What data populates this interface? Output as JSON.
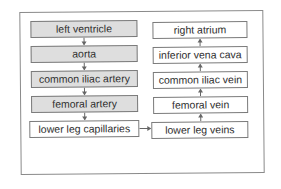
{
  "diagram": {
    "left_column": [
      {
        "label": "left ventricle",
        "style": "shaded"
      },
      {
        "label": "aorta",
        "style": "shaded"
      },
      {
        "label": "common iliac artery",
        "style": "shaded"
      },
      {
        "label": "femoral artery",
        "style": "shaded"
      },
      {
        "label": "lower leg capillaries",
        "style": "plain"
      }
    ],
    "right_column": [
      {
        "label": "right atrium",
        "style": "plain"
      },
      {
        "label": "inferior vena cava",
        "style": "plain"
      },
      {
        "label": "common iliac vein",
        "style": "plain"
      },
      {
        "label": "femoral vein",
        "style": "plain"
      },
      {
        "label": "lower leg veins",
        "style": "plain"
      }
    ],
    "connections": [
      {
        "from": "left ventricle",
        "to": "aorta",
        "direction": "down"
      },
      {
        "from": "aorta",
        "to": "common iliac artery",
        "direction": "down"
      },
      {
        "from": "common iliac artery",
        "to": "femoral artery",
        "direction": "down"
      },
      {
        "from": "femoral artery",
        "to": "lower leg capillaries",
        "direction": "down"
      },
      {
        "from": "lower leg capillaries",
        "to": "lower leg veins",
        "direction": "right"
      },
      {
        "from": "lower leg veins",
        "to": "femoral vein",
        "direction": "up"
      },
      {
        "from": "femoral vein",
        "to": "common iliac vein",
        "direction": "up"
      },
      {
        "from": "common iliac vein",
        "to": "inferior vena cava",
        "direction": "up"
      },
      {
        "from": "inferior vena cava",
        "to": "right atrium",
        "direction": "up"
      }
    ],
    "colors": {
      "artery_fill": "#dedede",
      "vein_fill": "#ffffff",
      "border": "#7a7a7a",
      "arrow": "#666666"
    }
  }
}
